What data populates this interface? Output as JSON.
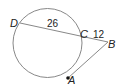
{
  "diagram": {
    "type": "circle-secant-tangent",
    "points": {
      "D": {
        "label": "D"
      },
      "C": {
        "label": "C"
      },
      "B": {
        "label": "B"
      },
      "A": {
        "label": "A"
      }
    },
    "segments": {
      "DC": {
        "label": "26"
      },
      "CB": {
        "label": "12"
      }
    },
    "colors": {
      "stroke": "#888888",
      "text": "#222222",
      "point": "#111111"
    }
  }
}
